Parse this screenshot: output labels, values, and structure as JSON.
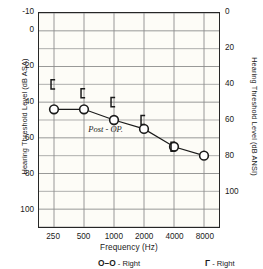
{
  "chart_data": {
    "type": "line",
    "title": "",
    "xlabel": "Frequency (Hz)",
    "ylabel": "Hearing Threshold Level (dB ASA)",
    "y2label": "Hearing Threshold Level (dB ANSI)",
    "categories": [
      "250",
      "500",
      "1000",
      "2000",
      "4000",
      "8000"
    ],
    "x_tick_labels": [
      "250",
      "500",
      "1000",
      "2000",
      "4000",
      "8000"
    ],
    "y_tick_labels": [
      "-10",
      "0",
      "20",
      "40",
      "60",
      "80",
      "100"
    ],
    "y_tick_values": [
      -10,
      0,
      20,
      40,
      60,
      80,
      100
    ],
    "y2_tick_labels": [
      "0",
      "20",
      "40",
      "60",
      "80",
      "100"
    ],
    "y2_tick_values": [
      -10,
      10,
      30,
      50,
      70,
      90
    ],
    "ylim": [
      -10,
      110
    ],
    "y_inverted": true,
    "grid": true,
    "grid_step": 10,
    "legend_position": "bottom",
    "annotations": [
      {
        "text": "Post - OP.",
        "x": "1000",
        "y": 57,
        "style": "italic"
      }
    ],
    "series": [
      {
        "name": "Right",
        "marker": "circle",
        "line": "solid",
        "values": [
          44,
          44,
          50,
          55,
          65,
          70
        ]
      },
      {
        "name": "Right",
        "marker": "bracket",
        "line": "none",
        "values": [
          30,
          35,
          40,
          50,
          65,
          null
        ]
      }
    ]
  },
  "axes": {
    "left_title": "Hearing Threshold Level (dB ASA)",
    "right_title": "Hearing Threshold Level (dB ANSI)",
    "x_title": "Frequency (Hz)"
  },
  "annotation": {
    "post_op": "Post - OP."
  },
  "legend": {
    "air_symbol": "O–O",
    "air_label": "- Right",
    "bone_symbol": "Γ",
    "bone_label": "- Right"
  },
  "colors": {
    "ink": "#1a1a1a",
    "frame": "#262626",
    "grid": "#8c8c8c",
    "plot_background": "#fdfcf7"
  }
}
